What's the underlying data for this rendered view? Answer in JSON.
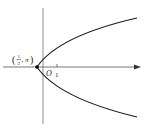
{
  "figure": {
    "type": "polar-curve-diagram",
    "curve": "parabola opening to the right",
    "point_label": {
      "prefix": "(",
      "numerator": "1",
      "denominator": "2",
      "separator": ", ",
      "angle": "π",
      "suffix": ")"
    },
    "origin_label": "O",
    "tick_label": "1",
    "colors": {
      "curve": "#1a1a1a",
      "axis": "#555555",
      "point": "#000000"
    }
  }
}
